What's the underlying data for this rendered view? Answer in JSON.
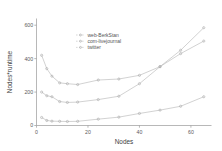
{
  "chart_data": {
    "type": "line",
    "title": "",
    "xlabel": "Nodes",
    "ylabel": "Nodes*runtime",
    "xlim": [
      0,
      68
    ],
    "ylim": [
      0,
      640
    ],
    "xticks": [
      0,
      20,
      40,
      60
    ],
    "yticks": [
      0,
      200,
      400,
      600
    ],
    "xticklabels": [
      "0",
      "20",
      "40",
      "60"
    ],
    "yticklabels": [
      "0",
      "200",
      "400",
      "600"
    ],
    "grid": false,
    "legend_position": "upper-center",
    "series": [
      {
        "name": "web-BerkStan",
        "marker": "point",
        "x": [
          2,
          4,
          6,
          9,
          12,
          16,
          24,
          32,
          40,
          48,
          56,
          65
        ],
        "y": [
          420,
          340,
          295,
          255,
          250,
          245,
          272,
          278,
          300,
          352,
          450,
          585
        ]
      },
      {
        "name": "com-livejournal",
        "marker": "point",
        "x": [
          2,
          4,
          6,
          9,
          12,
          16,
          24,
          32,
          40,
          48,
          56,
          65
        ],
        "y": [
          200,
          178,
          172,
          143,
          138,
          140,
          155,
          175,
          250,
          352,
          430,
          505
        ]
      },
      {
        "name": "twitter",
        "marker": "point",
        "x": [
          2,
          4,
          6,
          9,
          12,
          16,
          24,
          32,
          40,
          48,
          56,
          65
        ],
        "y": [
          48,
          30,
          26,
          25,
          24,
          25,
          38,
          50,
          72,
          92,
          115,
          172
        ]
      }
    ]
  },
  "colors": {
    "line": "#b9b9b9",
    "axis": "#9a9a9a",
    "text": "#555555",
    "background": "#ffffff"
  }
}
